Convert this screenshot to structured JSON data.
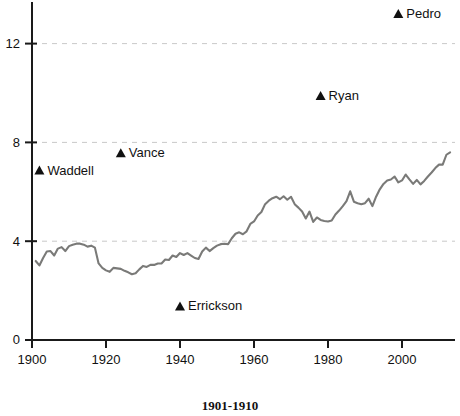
{
  "caption": "1901-1910",
  "chart_data": {
    "type": "line",
    "title": "",
    "xlabel": "",
    "ylabel": "",
    "xlim": [
      1898,
      2014
    ],
    "ylim": [
      0,
      13.9
    ],
    "grid": true,
    "grid_values": [
      4,
      8,
      12
    ],
    "legend": "none",
    "xticks": [
      1900,
      1920,
      1940,
      1960,
      1980,
      2000
    ],
    "xtick_labels": [
      "1900",
      "1920",
      "1940",
      "1960",
      "1980",
      "2000"
    ],
    "yticks": [
      0,
      4,
      8,
      12
    ],
    "ytick_labels": [
      "0",
      "4",
      "8",
      "12"
    ],
    "series": [
      {
        "name": "strikeouts-per-game",
        "color": "#7a7a78",
        "x": [
          1901,
          1902,
          1903,
          1904,
          1905,
          1906,
          1907,
          1908,
          1909,
          1910,
          1911,
          1912,
          1913,
          1914,
          1915,
          1916,
          1917,
          1918,
          1919,
          1920,
          1921,
          1922,
          1923,
          1924,
          1925,
          1926,
          1927,
          1928,
          1929,
          1930,
          1931,
          1932,
          1933,
          1934,
          1935,
          1936,
          1937,
          1938,
          1939,
          1940,
          1941,
          1942,
          1943,
          1944,
          1945,
          1946,
          1947,
          1948,
          1949,
          1950,
          1951,
          1952,
          1953,
          1954,
          1955,
          1956,
          1957,
          1958,
          1959,
          1960,
          1961,
          1962,
          1963,
          1964,
          1965,
          1966,
          1967,
          1968,
          1969,
          1970,
          1971,
          1972,
          1973,
          1974,
          1975,
          1976,
          1977,
          1978,
          1979,
          1980,
          1981,
          1982,
          1983,
          1984,
          1985,
          1986,
          1987,
          1988,
          1989,
          1990,
          1991,
          1992,
          1993,
          1994,
          1995,
          1996,
          1997,
          1998,
          1999,
          2000,
          2001,
          2002,
          2003,
          2004,
          2005,
          2006,
          2007,
          2008,
          2009,
          2010,
          2011,
          2012,
          2013
        ],
        "values": [
          3.2,
          3.02,
          3.32,
          3.58,
          3.6,
          3.42,
          3.7,
          3.76,
          3.6,
          3.8,
          3.86,
          3.9,
          3.9,
          3.86,
          3.78,
          3.82,
          3.74,
          3.1,
          2.92,
          2.82,
          2.76,
          2.92,
          2.9,
          2.88,
          2.8,
          2.74,
          2.66,
          2.7,
          2.86,
          3.0,
          2.96,
          3.04,
          3.04,
          3.1,
          3.1,
          3.26,
          3.24,
          3.42,
          3.36,
          3.52,
          3.44,
          3.52,
          3.42,
          3.32,
          3.28,
          3.58,
          3.74,
          3.6,
          3.72,
          3.82,
          3.88,
          3.9,
          3.88,
          4.12,
          4.3,
          4.36,
          4.28,
          4.4,
          4.7,
          4.8,
          5.04,
          5.18,
          5.5,
          5.64,
          5.74,
          5.8,
          5.7,
          5.82,
          5.68,
          5.8,
          5.5,
          5.36,
          5.2,
          4.92,
          5.2,
          4.78,
          4.96,
          4.86,
          4.82,
          4.8,
          4.84,
          5.08,
          5.24,
          5.42,
          5.62,
          6.02,
          5.6,
          5.54,
          5.5,
          5.54,
          5.72,
          5.42,
          5.8,
          6.1,
          6.32,
          6.46,
          6.5,
          6.62,
          6.38,
          6.46,
          6.7,
          6.5,
          6.32,
          6.48,
          6.3,
          6.44,
          6.62,
          6.78,
          6.96,
          7.1,
          7.1,
          7.5,
          7.6
        ]
      }
    ],
    "annotations": [
      {
        "label": "Waddell",
        "x": 1902,
        "y": 6.88,
        "label_side": "right"
      },
      {
        "label": "Vance",
        "x": 1924,
        "y": 7.58,
        "label_side": "right"
      },
      {
        "label": "Errickson",
        "x": 1940,
        "y": 1.38,
        "label_side": "right"
      },
      {
        "label": "Ryan",
        "x": 1978,
        "y": 9.9,
        "label_side": "right"
      },
      {
        "label": "Pedro",
        "x": 1999,
        "y": 13.22,
        "label_side": "right"
      }
    ]
  }
}
